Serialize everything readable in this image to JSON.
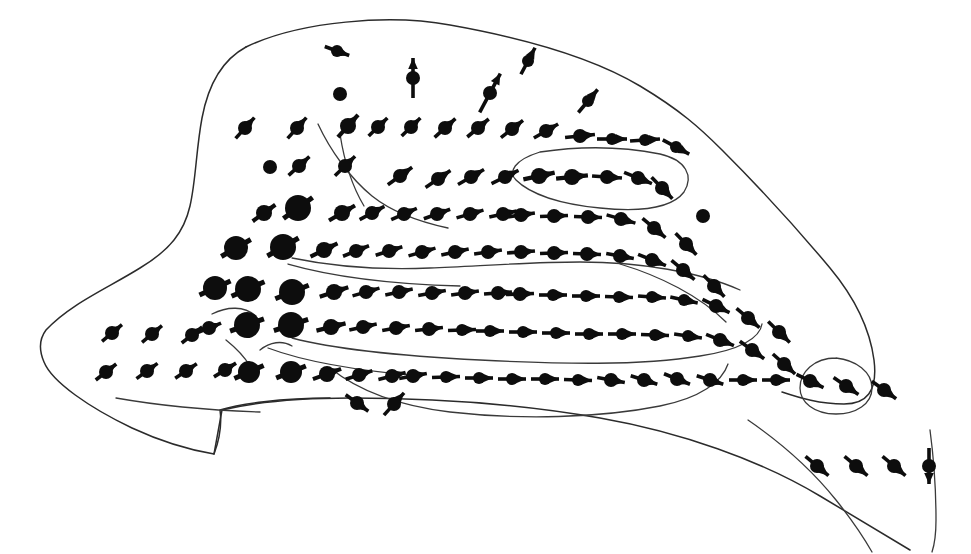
{
  "figure": {
    "background_color": "#ffffff",
    "ink_color": "#0d0d0d",
    "boundary_color": "#2b2b2b",
    "contour_color": "#3a3a3a",
    "width": 971,
    "height": 554
  },
  "chart_data": {
    "type": "scatter",
    "title": "",
    "subtitle": "",
    "xlabel": "",
    "ylabel": "",
    "xlim": [
      0,
      971
    ],
    "ylim": [
      0,
      554
    ],
    "grid": false,
    "legend": null,
    "annotations": [],
    "tick_labels": {
      "x": [],
      "y": []
    },
    "marker_semantics": "radius encodes magnitude class; arrow encodes direction (deg clockwise from east) and length encodes speed",
    "series": [
      {
        "name": "stations",
        "fields": [
          "x",
          "y",
          "r",
          "angle_deg",
          "len"
        ],
        "values": [
          [
            340,
            94,
            7,
            null,
            0
          ],
          [
            270,
            167,
            7,
            null,
            0
          ],
          [
            703,
            216,
            7,
            null,
            0
          ],
          [
            337,
            51,
            6,
            20,
            26
          ],
          [
            413,
            78,
            7,
            -90,
            40
          ],
          [
            490,
            93,
            7,
            -62,
            44
          ],
          [
            528,
            61,
            6,
            -62,
            30
          ],
          [
            588,
            101,
            6,
            -50,
            30
          ],
          [
            245,
            128,
            7,
            -48,
            28
          ],
          [
            297,
            128,
            7,
            -48,
            28
          ],
          [
            348,
            126,
            8,
            -48,
            30
          ],
          [
            378,
            127,
            7,
            -44,
            26
          ],
          [
            411,
            127,
            7,
            -44,
            26
          ],
          [
            445,
            128,
            7,
            -42,
            28
          ],
          [
            478,
            128,
            7,
            -40,
            28
          ],
          [
            512,
            129,
            7,
            -38,
            28
          ],
          [
            546,
            131,
            7,
            -30,
            28
          ],
          [
            580,
            136,
            7,
            -6,
            30
          ],
          [
            612,
            139,
            6,
            0,
            30
          ],
          [
            645,
            140,
            6,
            -4,
            30
          ],
          [
            676,
            147,
            6,
            28,
            30
          ],
          [
            299,
            166,
            7,
            -42,
            28
          ],
          [
            345,
            166,
            7,
            -44,
            28
          ],
          [
            400,
            176,
            7,
            -36,
            30
          ],
          [
            438,
            179,
            7,
            -34,
            30
          ],
          [
            471,
            177,
            7,
            -30,
            30
          ],
          [
            505,
            177,
            7,
            -26,
            30
          ],
          [
            539,
            176,
            8,
            -12,
            32
          ],
          [
            572,
            177,
            8,
            -6,
            32
          ],
          [
            607,
            177,
            7,
            4,
            30
          ],
          [
            638,
            178,
            7,
            22,
            30
          ],
          [
            662,
            188,
            7,
            46,
            30
          ],
          [
            264,
            213,
            8,
            -36,
            28
          ],
          [
            298,
            208,
            13,
            -36,
            36
          ],
          [
            342,
            213,
            8,
            -30,
            30
          ],
          [
            372,
            213,
            7,
            -28,
            28
          ],
          [
            404,
            214,
            7,
            -24,
            28
          ],
          [
            437,
            214,
            7,
            -20,
            28
          ],
          [
            470,
            214,
            7,
            -16,
            28
          ],
          [
            503,
            214,
            7,
            -12,
            28
          ],
          [
            521,
            215,
            7,
            -8,
            28
          ],
          [
            554,
            216,
            7,
            -2,
            28
          ],
          [
            588,
            217,
            7,
            2,
            28
          ],
          [
            621,
            219,
            7,
            16,
            30
          ],
          [
            654,
            228,
            7,
            40,
            30
          ],
          [
            686,
            244,
            7,
            46,
            30
          ],
          [
            236,
            248,
            12,
            -30,
            34
          ],
          [
            283,
            247,
            13,
            -30,
            36
          ],
          [
            324,
            250,
            8,
            -26,
            30
          ],
          [
            356,
            251,
            7,
            -22,
            28
          ],
          [
            389,
            251,
            7,
            -18,
            28
          ],
          [
            422,
            252,
            7,
            -16,
            28
          ],
          [
            455,
            252,
            7,
            -12,
            28
          ],
          [
            488,
            252,
            7,
            -8,
            28
          ],
          [
            521,
            252,
            7,
            -4,
            28
          ],
          [
            554,
            253,
            7,
            -2,
            28
          ],
          [
            587,
            254,
            7,
            2,
            28
          ],
          [
            620,
            256,
            7,
            10,
            28
          ],
          [
            652,
            260,
            7,
            22,
            30
          ],
          [
            683,
            270,
            7,
            40,
            30
          ],
          [
            714,
            286,
            7,
            46,
            30
          ],
          [
            215,
            288,
            12,
            -24,
            34
          ],
          [
            248,
            289,
            13,
            -24,
            36
          ],
          [
            292,
            292,
            13,
            -22,
            36
          ],
          [
            334,
            292,
            8,
            -18,
            30
          ],
          [
            366,
            292,
            7,
            -16,
            28
          ],
          [
            399,
            292,
            7,
            -12,
            28
          ],
          [
            432,
            293,
            7,
            -10,
            28
          ],
          [
            465,
            293,
            7,
            -8,
            28
          ],
          [
            498,
            293,
            7,
            -4,
            28
          ],
          [
            520,
            294,
            7,
            -2,
            28
          ],
          [
            553,
            295,
            6,
            0,
            28
          ],
          [
            586,
            296,
            6,
            0,
            28
          ],
          [
            619,
            297,
            6,
            2,
            28
          ],
          [
            652,
            297,
            6,
            4,
            28
          ],
          [
            684,
            300,
            6,
            12,
            28
          ],
          [
            716,
            306,
            7,
            26,
            30
          ],
          [
            748,
            318,
            7,
            40,
            30
          ],
          [
            779,
            332,
            7,
            44,
            30
          ],
          [
            209,
            328,
            7,
            -22,
            26
          ],
          [
            247,
            325,
            13,
            -20,
            36
          ],
          [
            291,
            325,
            13,
            -18,
            36
          ],
          [
            331,
            327,
            8,
            -14,
            30
          ],
          [
            363,
            327,
            7,
            -12,
            28
          ],
          [
            396,
            328,
            7,
            -10,
            28
          ],
          [
            429,
            329,
            7,
            -6,
            28
          ],
          [
            462,
            330,
            6,
            -2,
            28
          ],
          [
            490,
            331,
            6,
            0,
            28
          ],
          [
            523,
            332,
            6,
            0,
            28
          ],
          [
            556,
            333,
            6,
            0,
            28
          ],
          [
            589,
            334,
            6,
            0,
            28
          ],
          [
            622,
            334,
            6,
            0,
            28
          ],
          [
            655,
            335,
            6,
            2,
            28
          ],
          [
            688,
            336,
            6,
            8,
            28
          ],
          [
            720,
            340,
            7,
            22,
            30
          ],
          [
            752,
            350,
            7,
            36,
            30
          ],
          [
            784,
            364,
            7,
            42,
            30
          ],
          [
            112,
            333,
            7,
            -40,
            26
          ],
          [
            152,
            334,
            7,
            -40,
            26
          ],
          [
            192,
            335,
            7,
            -38,
            26
          ],
          [
            106,
            372,
            7,
            -38,
            26
          ],
          [
            147,
            371,
            7,
            -36,
            26
          ],
          [
            186,
            371,
            7,
            -34,
            26
          ],
          [
            225,
            370,
            7,
            -32,
            26
          ],
          [
            249,
            372,
            11,
            -24,
            32
          ],
          [
            291,
            372,
            11,
            -22,
            32
          ],
          [
            327,
            374,
            8,
            -20,
            30
          ],
          [
            359,
            375,
            7,
            -18,
            28
          ],
          [
            392,
            376,
            7,
            -14,
            28
          ],
          [
            413,
            376,
            7,
            -10,
            28
          ],
          [
            446,
            377,
            6,
            -2,
            28
          ],
          [
            479,
            378,
            6,
            0,
            28
          ],
          [
            512,
            379,
            6,
            0,
            28
          ],
          [
            545,
            379,
            6,
            0,
            28
          ],
          [
            578,
            380,
            6,
            2,
            28
          ],
          [
            611,
            380,
            7,
            10,
            28
          ],
          [
            644,
            380,
            7,
            18,
            28
          ],
          [
            677,
            379,
            7,
            22,
            28
          ],
          [
            710,
            380,
            7,
            18,
            28
          ],
          [
            743,
            380,
            6,
            0,
            28
          ],
          [
            776,
            380,
            6,
            0,
            28
          ],
          [
            810,
            381,
            7,
            26,
            30
          ],
          [
            846,
            386,
            7,
            34,
            30
          ],
          [
            884,
            390,
            7,
            36,
            30
          ],
          [
            357,
            403,
            7,
            36,
            28
          ],
          [
            394,
            404,
            7,
            -48,
            30
          ],
          [
            817,
            466,
            7,
            40,
            30
          ],
          [
            856,
            466,
            7,
            40,
            30
          ],
          [
            894,
            466,
            7,
            40,
            30
          ],
          [
            929,
            466,
            7,
            90,
            36
          ]
        ]
      }
    ]
  },
  "geometry": {
    "boundary_main": "M 246 47 C 300 21 390 14 450 25 C 540 41 600 62 640 86 C 680 110 700 128 722 150 C 760 188 800 232 830 268 C 855 298 870 330 874 360 C 878 392 866 404 844 404 C 820 404 800 398 782 392",
    "boundary_left": "M 246 47 C 222 60 208 86 202 118 C 196 150 196 180 190 206 C 184 232 170 250 140 268 C 108 288 70 304 46 330 C 40 338 38 348 44 362 C 52 382 90 408 132 428 C 160 441 190 450 214 454 C 220 438 222 424 220 410 C 240 404 280 398 330 398",
    "boundary_bottom": "M 214 454 L 222 410 C 256 402 300 398 350 398 C 430 398 520 404 600 418 C 680 432 760 460 820 496 C 860 520 890 538 910 550",
    "contours": [
      "M 318 124 C 330 150 350 178 372 196 C 392 212 420 222 448 228",
      "M 340 134 C 344 160 352 186 364 206",
      "M 540 152 C 580 146 620 146 660 154 C 686 160 694 176 684 192 C 672 208 640 212 600 208 C 560 204 530 194 516 180 C 508 172 514 160 540 152",
      "M 292 258 C 330 266 380 270 430 268 C 480 266 530 262 580 262 C 640 262 700 272 740 290",
      "M 288 264 C 330 276 390 284 460 286",
      "M 620 264 C 660 276 700 296 726 322",
      "M 292 338 C 330 348 400 356 480 360 C 560 364 640 366 700 356 C 740 350 760 338 762 324",
      "M 268 348 C 300 360 350 370 420 376",
      "M 330 368 C 360 392 400 406 450 412 C 520 420 600 418 660 406 C 700 398 722 382 728 364",
      "M 116 398 C 150 404 200 410 260 412",
      "M 836 358 C 856 360 872 372 872 388 C 872 404 856 414 836 414 C 814 414 800 402 800 388 C 800 372 814 358 836 358",
      "M 748 420 C 780 442 812 470 836 500 C 852 520 864 538 872 552",
      "M 930 430 C 934 460 936 492 936 520 C 936 536 934 546 932 552",
      "M 212 314 C 228 306 244 306 256 316",
      "M 226 340 C 236 348 244 356 250 366",
      "M 260 350 C 270 342 282 340 292 346"
    ]
  }
}
